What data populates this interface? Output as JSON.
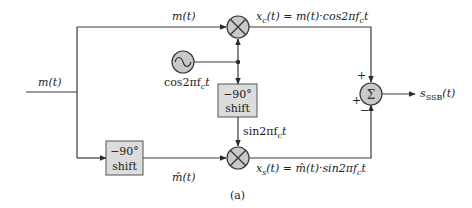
{
  "diagram": {
    "caption": "(a)",
    "input_label": "m(t)",
    "upper_path_label": "m(t)",
    "oscillator_label": "cos2πf",
    "oscillator_label_sub": "c",
    "oscillator_label_t": "t",
    "top_shift": {
      "line1": "−90°",
      "line2": "shift"
    },
    "left_shift": {
      "line1": "−90°",
      "line2": "shift"
    },
    "sin_label": "sin2πf",
    "sin_label_sub": "c",
    "sin_label_t": "t",
    "hilbert_label": "m̂(t)",
    "xc_label": {
      "lhs": "x",
      "lhs_sub": "c",
      "rhs": "(t) = m(t)·cos2πf",
      "rhs_sub": "c",
      "tail": "t"
    },
    "xs_label": {
      "lhs": "x",
      "lhs_sub": "s",
      "rhs": "(t) = m̂(t)·sin2πf",
      "rhs_sub": "c",
      "tail": "t"
    },
    "summer": {
      "symbol": "Σ",
      "sign_top": "+",
      "sign_left": "+",
      "sign_bottom": "−"
    },
    "multiplier_symbol": "×",
    "oscillator_symbol": "~",
    "output_label": "s",
    "output_label_sub": "SSB",
    "output_label_tail": "(t)"
  }
}
